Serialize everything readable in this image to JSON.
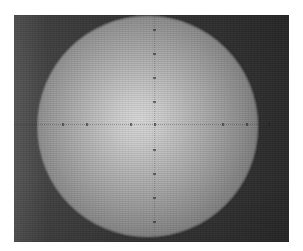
{
  "image": {
    "description": "Grayscale micrograph of a single large sphere against a dark background with a faint dotted reticle crosshair",
    "subject": "sphere",
    "colors": {
      "page_background": "#ffffff",
      "image_background_left": "#585858",
      "image_background_right": "#2a2a2a",
      "sphere_center": "#d8d8d8",
      "sphere_edge": "#3c3c3c"
    },
    "reticle": {
      "horizontal_ticks_x": [
        48,
        72,
        116,
        140,
        208,
        232,
        254
      ],
      "vertical_ticks_y": [
        14,
        38,
        62,
        86,
        134,
        158,
        182,
        206
      ]
    }
  }
}
